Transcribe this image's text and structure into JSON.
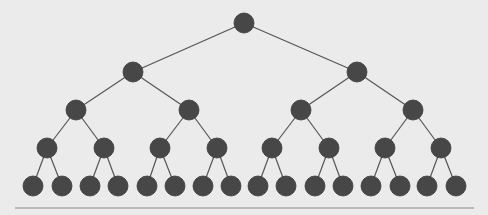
{
  "diagram": {
    "type": "binary-tree",
    "depth": 5,
    "colors": {
      "background": "#ebebeb",
      "node_fill": "#474747",
      "edge": "#555555",
      "baseline": "#8a8a8a"
    },
    "node_radius": 10,
    "levels": [
      {
        "y": 23,
        "x": [
          244
        ]
      },
      {
        "y": 72,
        "x": [
          133,
          357
        ]
      },
      {
        "y": 110,
        "x": [
          76,
          189,
          301,
          413
        ]
      },
      {
        "y": 148,
        "x": [
          47,
          104,
          160,
          217,
          272,
          329,
          385,
          441
        ]
      },
      {
        "y": 186,
        "x": [
          33,
          62,
          90,
          118,
          147,
          175,
          203,
          231,
          258,
          286,
          315,
          343,
          371,
          400,
          427,
          456
        ]
      }
    ],
    "baseline": {
      "y": 208,
      "x1": 15,
      "x2": 474
    }
  }
}
